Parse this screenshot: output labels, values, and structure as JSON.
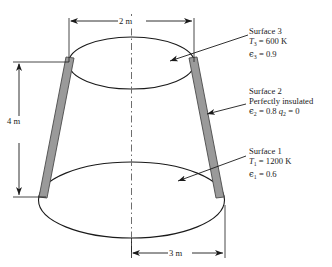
{
  "figure": {
    "type": "truncated-cone-radiation-enclosure",
    "colors": {
      "line": "#1a1a1a",
      "wall_fill": "#9a9a9a",
      "wall_stroke": "#555555",
      "background": "#ffffff"
    }
  },
  "dimensions": [
    {
      "id": "top-diameter",
      "label": "2 m",
      "value": 2,
      "unit": "m",
      "orientation": "horizontal"
    },
    {
      "id": "height",
      "label": "4 m",
      "value": 4,
      "unit": "m",
      "orientation": "vertical"
    },
    {
      "id": "bottom-diameter",
      "label": "3 m",
      "value": 3,
      "unit": "m",
      "orientation": "horizontal"
    }
  ],
  "surfaces": [
    {
      "id": "surface-3",
      "title": "Surface 3",
      "temperature_symbol": "T",
      "temperature_subscript": "3",
      "temperature_value": "600 K",
      "temperature_line": "= 600 K",
      "emissivity_symbol": "ϵ",
      "emissivity_subscript": "3",
      "emissivity_value": "0.9",
      "emissivity_line": "= 0.9",
      "note": ""
    },
    {
      "id": "surface-2",
      "title": "Surface 2",
      "note": "Perfectly insulated",
      "emissivity_symbol": "ϵ",
      "emissivity_subscript": "2",
      "emissivity_value": "0.8",
      "emissivity_line": "= 0.8",
      "flux_symbol": "q",
      "flux_subscript": "2",
      "flux_value": "0",
      "flux_line": "= 0"
    },
    {
      "id": "surface-1",
      "title": "Surface 1",
      "temperature_symbol": "T",
      "temperature_subscript": "1",
      "temperature_value": "1200 K",
      "temperature_line": "= 1200 K",
      "emissivity_symbol": "ϵ",
      "emissivity_subscript": "1",
      "emissivity_value": "0.6",
      "emissivity_line": "= 0.6",
      "note": ""
    }
  ]
}
